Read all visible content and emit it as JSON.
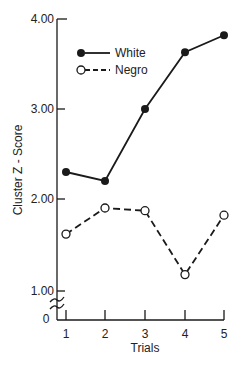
{
  "chart_data": {
    "type": "line",
    "title": "",
    "xlabel": "Trials",
    "ylabel": "Cluster Z - Score",
    "x": [
      1,
      2,
      3,
      4,
      5
    ],
    "categories": [
      "1",
      "2",
      "3",
      "4",
      "5"
    ],
    "yticks": [
      "4.00",
      "3.00",
      "2.00",
      "1.00"
    ],
    "ytick_values": [
      4.0,
      3.0,
      2.0,
      1.0
    ],
    "y_origin_label": "0",
    "axis_break": true,
    "ylim": [
      1.0,
      4.0
    ],
    "grid": false,
    "legend_position": "upper-left",
    "series": [
      {
        "name": "White",
        "style": "solid",
        "marker": "filled-circle",
        "values": [
          2.3,
          2.2,
          3.0,
          3.63,
          3.82
        ]
      },
      {
        "name": "Negro",
        "style": "dashed",
        "marker": "open-circle",
        "values": [
          1.61,
          1.9,
          1.87,
          1.16,
          1.82
        ]
      }
    ]
  },
  "axes": {
    "y_title": "Cluster Z - Score",
    "x_title": "Trials",
    "origin": "0",
    "y_ticks": [
      "4.00",
      "3.00",
      "2.00",
      "1.00"
    ],
    "x_ticks": [
      "1",
      "2",
      "3",
      "4",
      "5"
    ]
  },
  "legend": {
    "items": [
      {
        "label": "White"
      },
      {
        "label": "Negro"
      }
    ]
  },
  "colors": {
    "ink": "#1a1a1a",
    "background": "#ffffff"
  }
}
